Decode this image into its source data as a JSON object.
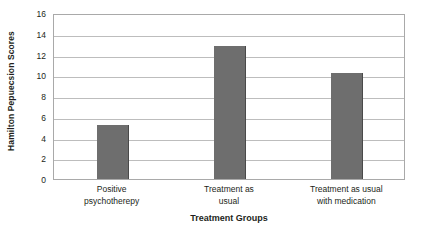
{
  "chart_data": {
    "type": "bar",
    "title": "",
    "categories": [
      "Positive psychotherepy",
      "Treatment as usual",
      "Treatment as usual with medication"
    ],
    "category_lines": [
      [
        "Positive",
        "psychotherepy"
      ],
      [
        "Treatment as",
        "usual"
      ],
      [
        "Treatment as usual",
        "with medication"
      ]
    ],
    "values": [
      5.2,
      12.8,
      10.2
    ],
    "xlabel": "Treatment Groups",
    "ylabel": "Hamilton Pepuecsion Scores",
    "ylim": [
      0,
      16
    ],
    "yticks": [
      0,
      2,
      4,
      6,
      8,
      10,
      12,
      14,
      16
    ],
    "ytick_labels": [
      "0",
      "2",
      "4",
      "6",
      "8",
      "10",
      "12",
      "14",
      "16"
    ],
    "grid": true,
    "legend": false,
    "bar_color": "#6e6e6e",
    "bar_edge_color": "#4a4a4a",
    "gridline_color": "#bdbdbd",
    "plot_border_color": "#a9a9a9",
    "background_color": "#ffffff"
  }
}
